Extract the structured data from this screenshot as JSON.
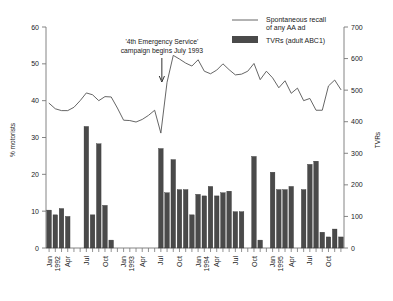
{
  "chart_data": {
    "type": "bar",
    "title": "",
    "subtitle": "",
    "xlabel": "",
    "ylabel": "% motorists",
    "y2label": "TVRs",
    "ylim": [
      0,
      60
    ],
    "y2lim": [
      0,
      700
    ],
    "yticks": [
      "0",
      "10",
      "20",
      "30",
      "40",
      "50",
      "60"
    ],
    "y2ticks": [
      "0",
      "100",
      "200",
      "300",
      "400",
      "500",
      "600",
      "700"
    ],
    "grid": false,
    "legend_position": "top-right",
    "legend": [
      {
        "label_line1": "Spontaneous recall",
        "label_line2": "of any AA ad",
        "marker": "line",
        "color": "#555555"
      },
      {
        "label_line1": "TVRs (adult ABC1)",
        "label_line2": "",
        "marker": "bar",
        "color": "#4a4a4a"
      }
    ],
    "annotations": [
      {
        "text_line1": "'4th Emergency Service'",
        "text_line2": "campaign begins July 1993",
        "arrow": "down-arrow",
        "points_to_month": "1993-07"
      }
    ],
    "x_tick_labels": [
      {
        "month": "1992-01",
        "line1": "Jan",
        "line2": "1992"
      },
      {
        "month": "1992-04",
        "line1": "Apr",
        "line2": ""
      },
      {
        "month": "1992-07",
        "line1": "Jul",
        "line2": ""
      },
      {
        "month": "1992-10",
        "line1": "Oct",
        "line2": ""
      },
      {
        "month": "1993-01",
        "line1": "Jan",
        "line2": "1993"
      },
      {
        "month": "1993-04",
        "line1": "Apr",
        "line2": ""
      },
      {
        "month": "1993-07",
        "line1": "Jul",
        "line2": ""
      },
      {
        "month": "1993-10",
        "line1": "Oct",
        "line2": ""
      },
      {
        "month": "1994-01",
        "line1": "Jan",
        "line2": "1994"
      },
      {
        "month": "1994-04",
        "line1": "Apr",
        "line2": ""
      },
      {
        "month": "1994-07",
        "line1": "Jul",
        "line2": ""
      },
      {
        "month": "1994-10",
        "line1": "Oct",
        "line2": ""
      },
      {
        "month": "1995-01",
        "line1": "Jan",
        "line2": "1995"
      },
      {
        "month": "1995-04",
        "line1": "Apr",
        "line2": ""
      },
      {
        "month": "1995-07",
        "line1": "Jul",
        "line2": ""
      },
      {
        "month": "1995-10",
        "line1": "Oct",
        "line2": ""
      }
    ],
    "x": [
      "1992-01",
      "1992-02",
      "1992-03",
      "1992-04",
      "1992-05",
      "1992-06",
      "1992-07",
      "1992-08",
      "1992-09",
      "1992-10",
      "1992-11",
      "1992-12",
      "1993-01",
      "1993-02",
      "1993-03",
      "1993-04",
      "1993-05",
      "1993-06",
      "1993-07",
      "1993-08",
      "1993-09",
      "1993-10",
      "1993-11",
      "1993-12",
      "1994-01",
      "1994-02",
      "1994-03",
      "1994-04",
      "1994-05",
      "1994-06",
      "1994-07",
      "1994-08",
      "1994-09",
      "1994-10",
      "1994-11",
      "1994-12",
      "1995-01",
      "1995-02",
      "1995-03",
      "1995-04",
      "1995-05",
      "1995-06",
      "1995-07",
      "1995-08",
      "1995-09",
      "1995-10",
      "1995-11",
      "1995-12"
    ],
    "series": [
      {
        "name": "TVRs (adult ABC1)",
        "axis": "right",
        "type": "bar",
        "color": "#4a4a4a",
        "unit": "TVRs",
        "values": [
          120,
          105,
          125,
          100,
          0,
          0,
          385,
          105,
          330,
          135,
          25,
          0,
          0,
          0,
          0,
          0,
          0,
          0,
          315,
          175,
          280,
          185,
          185,
          105,
          170,
          165,
          195,
          165,
          175,
          180,
          115,
          115,
          0,
          290,
          25,
          0,
          240,
          185,
          185,
          195,
          0,
          185,
          265,
          275,
          50,
          35,
          60,
          35
        ]
      },
      {
        "name": "Spontaneous recall of any AA ad",
        "axis": "left",
        "type": "line",
        "color": "#555555",
        "unit": "% motorists",
        "values": [
          39.3,
          37.8,
          37.3,
          37.3,
          38.2,
          40.0,
          42.1,
          41.6,
          40.0,
          41.1,
          41.0,
          38.0,
          34.7,
          34.6,
          34.2,
          34.9,
          36.0,
          37.4,
          31.2,
          45.0,
          52.3,
          51.3,
          50.2,
          49.4,
          51.1,
          48.0,
          47.3,
          48.3,
          50.0,
          48.4,
          47.0,
          47.2,
          48.0,
          50.1,
          45.7,
          48.0,
          46.2,
          43.5,
          45.4,
          42.0,
          43.4,
          40.0,
          40.6,
          37.4,
          37.4,
          44.0,
          45.6,
          43.0
        ]
      }
    ]
  }
}
